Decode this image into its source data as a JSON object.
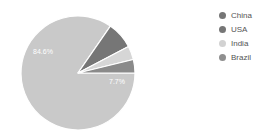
{
  "chart_data": {
    "type": "pie",
    "title": "",
    "legend_position": "right",
    "categories": [
      "China",
      "USA",
      "India",
      "Brazil"
    ],
    "values": [
      84.6,
      7.7,
      3.9,
      3.8
    ],
    "value_labels": [
      "84.6%",
      "7.7%",
      "",
      ""
    ],
    "visible_slice_labels": [
      {
        "text": "84.6%",
        "x": 43,
        "y": 54
      },
      {
        "text": "7.7%",
        "x": 117,
        "y": 84
      }
    ],
    "colors": [
      "#c9c9c9",
      "#767676",
      "#d6d6d6",
      "#8a8a8a"
    ],
    "geometry": {
      "cx": 78,
      "cy": 73,
      "radius": 57,
      "start_angle_deg": 0,
      "separator_color": "#ffffff",
      "separator_width": 1.2
    }
  },
  "legend": {
    "items": [
      {
        "label": "China",
        "color": "#767676"
      },
      {
        "label": "USA",
        "color": "#767676"
      },
      {
        "label": "India",
        "color": "#d2d2d2"
      },
      {
        "label": "Brazil",
        "color": "#8f8f8f"
      }
    ]
  },
  "canvas": {
    "background": "#ffffff",
    "width": 271,
    "height": 139
  }
}
